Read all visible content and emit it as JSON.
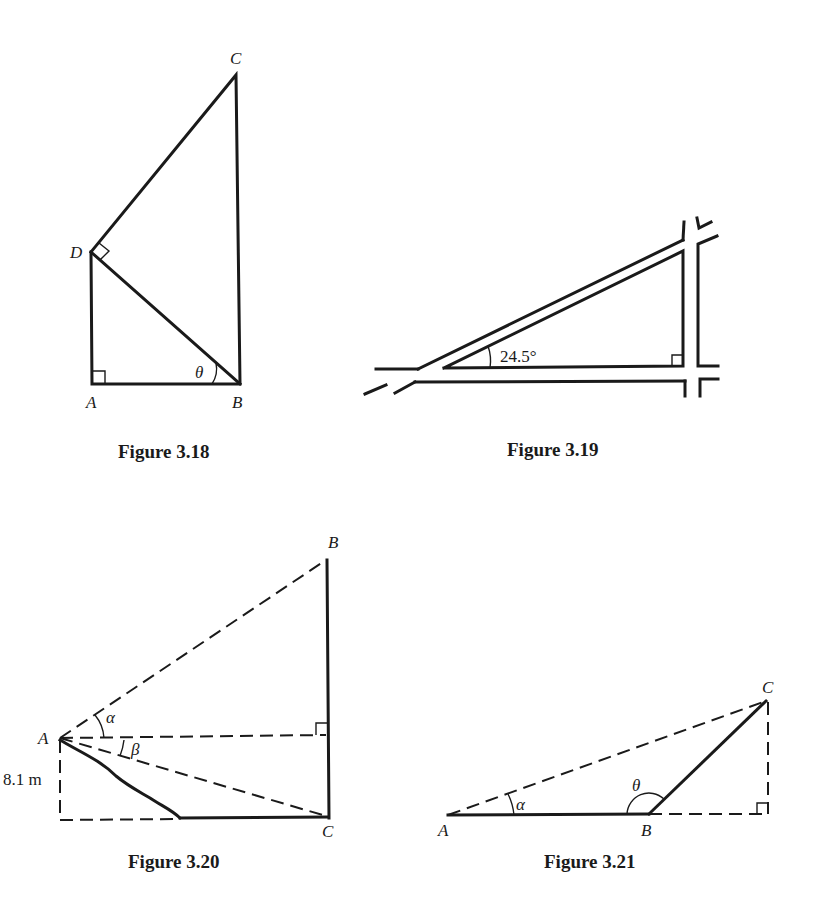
{
  "figures": [
    {
      "id": "fig318",
      "caption": "Figure 3.18",
      "labels": {
        "A": "A",
        "B": "B",
        "C": "C",
        "D": "D",
        "angle": "θ"
      },
      "right_angles": [
        "A",
        "D"
      ]
    },
    {
      "id": "fig319",
      "caption": "Figure 3.19",
      "labels": {
        "angle": "24.5°"
      },
      "right_angles": [
        "corner"
      ]
    },
    {
      "id": "fig320",
      "caption": "Figure 3.20",
      "labels": {
        "A": "A",
        "B": "B",
        "C": "C",
        "alpha": "α",
        "beta": "β",
        "height": "8.1 m"
      },
      "right_angles": [
        "foot-of-B"
      ]
    },
    {
      "id": "fig321",
      "caption": "Figure 3.21",
      "labels": {
        "A": "A",
        "B": "B",
        "C": "C",
        "alpha": "α",
        "theta": "θ"
      },
      "right_angles": [
        "foot-of-C"
      ]
    }
  ]
}
